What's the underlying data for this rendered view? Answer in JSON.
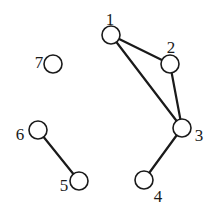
{
  "graph": {
    "nodes": [
      {
        "id": "1",
        "label": "1"
      },
      {
        "id": "2",
        "label": "2"
      },
      {
        "id": "3",
        "label": "3"
      },
      {
        "id": "4",
        "label": "4"
      },
      {
        "id": "5",
        "label": "5"
      },
      {
        "id": "6",
        "label": "6"
      },
      {
        "id": "7",
        "label": "7"
      }
    ],
    "edges": [
      {
        "source": "1",
        "target": "2"
      },
      {
        "source": "1",
        "target": "3"
      },
      {
        "source": "2",
        "target": "3"
      },
      {
        "source": "3",
        "target": "4"
      },
      {
        "source": "6",
        "target": "5"
      }
    ]
  }
}
